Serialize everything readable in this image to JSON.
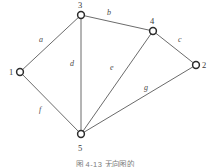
{
  "figure": {
    "caption": "图 4-13   无向图的",
    "graph_type": "undirected graph",
    "vertex_count": 5,
    "edge_count": 7
  },
  "colors": {
    "edge": "#5a5a5a",
    "vertex_stroke": "#2b2b2b",
    "vertex_fill": "#ffffff",
    "label_text": "#4a4a4a",
    "background": "#ffffff"
  },
  "chart_data": {
    "type": "diagram",
    "title": "图 4-13   无向图的",
    "vertices": [
      {
        "id": "1",
        "label": "1",
        "x": 20,
        "y": 72,
        "label_x": 9,
        "label_y": 68
      },
      {
        "id": "2",
        "label": "2",
        "x": 196,
        "y": 65,
        "label_x": 202,
        "label_y": 61
      },
      {
        "id": "3",
        "label": "3",
        "x": 81,
        "y": 15,
        "label_x": 78,
        "label_y": 1
      },
      {
        "id": "4",
        "label": "4",
        "x": 153,
        "y": 31,
        "label_x": 150,
        "label_y": 17
      },
      {
        "id": "5",
        "label": "5",
        "x": 81,
        "y": 134,
        "label_x": 78,
        "label_y": 144
      }
    ],
    "edges": [
      {
        "id": "a",
        "label": "a",
        "from": "1",
        "to": "3",
        "label_x": 39,
        "label_y": 36
      },
      {
        "id": "b",
        "label": "b",
        "from": "3",
        "to": "4",
        "label_x": 107,
        "label_y": 9
      },
      {
        "id": "c",
        "label": "c",
        "from": "4",
        "to": "2",
        "label_x": 178,
        "label_y": 36
      },
      {
        "id": "d",
        "label": "d",
        "from": "3",
        "to": "5",
        "label_x": 70,
        "label_y": 60
      },
      {
        "id": "e",
        "label": "e",
        "from": "4",
        "to": "5",
        "label_x": 110,
        "label_y": 64
      },
      {
        "id": "f",
        "label": "f",
        "from": "1",
        "to": "5",
        "label_x": 39,
        "label_y": 106
      },
      {
        "id": "g",
        "label": "g",
        "from": "5",
        "to": "2",
        "label_x": 144,
        "label_y": 84
      }
    ]
  }
}
